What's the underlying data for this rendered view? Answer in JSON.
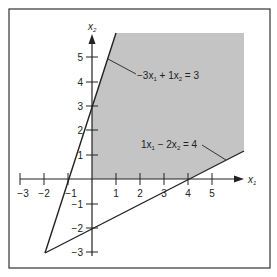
{
  "diagram": {
    "type": "linear-programming-feasible-region",
    "axes": {
      "x_label": "x",
      "x_sub": "1",
      "y_label": "x",
      "y_sub": "2",
      "x_ticks": [
        "−3",
        "−2",
        "−1",
        "1",
        "2",
        "3",
        "4",
        "5"
      ],
      "x_tick_values": [
        -3,
        -2,
        -1,
        1,
        2,
        3,
        4,
        5
      ],
      "y_ticks": [
        "5",
        "4",
        "3",
        "2",
        "1",
        "−1",
        "−2",
        "−3"
      ],
      "y_tick_values": [
        5,
        4,
        3,
        2,
        1,
        -1,
        -2,
        -3
      ]
    },
    "constraints": [
      {
        "label": "−3x₁ + 1x₂ = 3",
        "parts": [
          "−3x",
          "1",
          " + 1x",
          "2",
          " = 3"
        ]
      },
      {
        "label": "1x₁ − 2x₂ = 4",
        "parts": [
          "1x",
          "1",
          " − 2x",
          "2",
          " = 4"
        ]
      }
    ],
    "intersection_point": [
      -2,
      -3
    ],
    "shaded_region": "x₁ ≥ 0, x₂ ≥ 0, −3x₁ + x₂ ≤ 3, x₁ − 2x₂ ≤ 4",
    "colors": {
      "shade": "#c4c4c4",
      "line": "#222222",
      "border": "#333333",
      "background": "#ffffff"
    }
  }
}
